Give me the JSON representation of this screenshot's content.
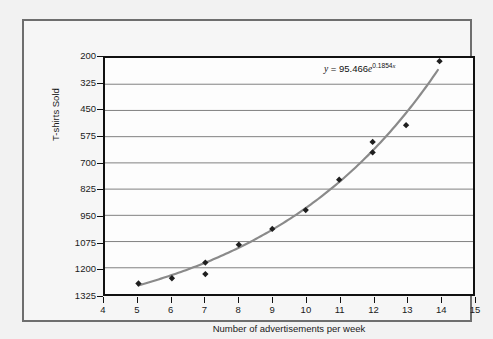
{
  "chart_data": {
    "type": "scatter",
    "title": "",
    "xlabel": "Number of advertisements per week",
    "ylabel": "T-shirts Sold",
    "xlim": [
      4,
      15
    ],
    "ylim": [
      200,
      1325
    ],
    "xticks": [
      4,
      5,
      6,
      7,
      8,
      9,
      10,
      11,
      12,
      13,
      14,
      15
    ],
    "yticks": [
      200,
      325,
      450,
      575,
      700,
      825,
      950,
      1075,
      1200,
      1325
    ],
    "grid": "horizontal",
    "legend": "none",
    "series": [
      {
        "name": "T-shirts Sold",
        "marker": "diamond",
        "marker_color": "#1f1f1f",
        "points": [
          {
            "x": 5,
            "y": 250
          },
          {
            "x": 6,
            "y": 275
          },
          {
            "x": 7,
            "y": 350
          },
          {
            "x": 7,
            "y": 295
          },
          {
            "x": 8,
            "y": 435
          },
          {
            "x": 9,
            "y": 510
          },
          {
            "x": 10,
            "y": 600
          },
          {
            "x": 11,
            "y": 745
          },
          {
            "x": 12,
            "y": 925
          },
          {
            "x": 12,
            "y": 875
          },
          {
            "x": 13,
            "y": 1005
          },
          {
            "x": 14,
            "y": 1310
          }
        ]
      }
    ],
    "trendline": {
      "type": "exponential",
      "a": 95.466,
      "b": 0.1854,
      "color": "#8a8a8a",
      "x_start": 5,
      "x_end": 13.95
    },
    "annotations": [
      {
        "name": "trendline-equation",
        "y_var": "y",
        "equals": " = 95.466",
        "e_var": "e",
        "exponent": "0.1854",
        "exponent_var": "x"
      }
    ]
  },
  "axes": {
    "y_tick_labels": [
      "1325",
      "1200",
      "1075",
      "950",
      "825",
      "700",
      "575",
      "450",
      "325",
      "200"
    ],
    "x_tick_labels": [
      "4",
      "5",
      "6",
      "7",
      "8",
      "9",
      "10",
      "11",
      "12",
      "13",
      "14",
      "15"
    ],
    "y_title": "T-shirts Sold",
    "x_title": "Number of advertisements per week"
  },
  "colors": {
    "page_background": "#f2f2f2",
    "panel_background": "#f6f6f6",
    "panel_border": "#6e6e6e",
    "plot_background": "#fdfdfd",
    "plot_border": "#111111",
    "gridline": "#7f7f7f",
    "marker": "#1f1f1f",
    "trendline": "#8a8a8a",
    "text": "#1a1a1a"
  }
}
